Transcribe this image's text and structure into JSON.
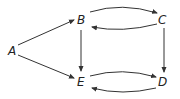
{
  "diagram": {
    "type": "directed-graph",
    "colors": {
      "stroke": "#333333",
      "text": "#222222",
      "background": "#ffffff"
    },
    "nodes": [
      {
        "id": "A",
        "label": "A"
      },
      {
        "id": "B",
        "label": "B"
      },
      {
        "id": "C",
        "label": "C"
      },
      {
        "id": "D",
        "label": "D"
      },
      {
        "id": "E",
        "label": "E"
      }
    ],
    "edges": [
      {
        "from": "A",
        "to": "B",
        "style": "straight"
      },
      {
        "from": "A",
        "to": "E",
        "style": "straight"
      },
      {
        "from": "B",
        "to": "C",
        "style": "curved"
      },
      {
        "from": "C",
        "to": "B",
        "style": "curved"
      },
      {
        "from": "B",
        "to": "E",
        "style": "straight"
      },
      {
        "from": "C",
        "to": "D",
        "style": "straight"
      },
      {
        "from": "E",
        "to": "D",
        "style": "curved"
      },
      {
        "from": "D",
        "to": "E",
        "style": "curved"
      }
    ]
  }
}
